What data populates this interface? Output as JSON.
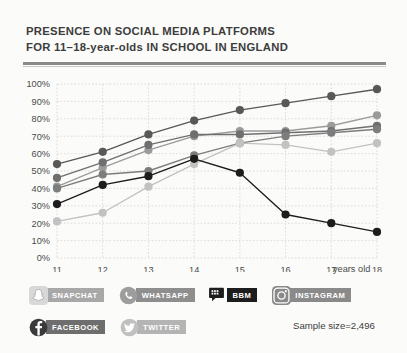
{
  "title": {
    "line1": "PRESENCE ON SOCIAL MEDIA PLATFORMS",
    "line2": "FOR 11–18-year-olds IN SCHOOL IN ENGLAND"
  },
  "axis": {
    "x_label": "years old",
    "y_ticks": [
      "0%",
      "10%",
      "20%",
      "30%",
      "40%",
      "50%",
      "60%",
      "70%",
      "80%",
      "90%",
      "100%"
    ],
    "x_ticks": [
      "11",
      "12",
      "13",
      "14",
      "15",
      "16",
      "17",
      "18"
    ]
  },
  "footnote": {
    "sample_size": "Sample size=2,496"
  },
  "legend": {
    "row1": [
      {
        "label": "SNAPCHAT",
        "icon": "snapchat-icon",
        "badge_color": "#a8a8a8",
        "line_color": "#9b9b9b"
      },
      {
        "label": "WHATSAPP",
        "icon": "whatsapp-icon",
        "badge_color": "#8e8e8e",
        "line_color": "#7d7d7d"
      },
      {
        "label": "BBM",
        "icon": "bbm-icon",
        "badge_color": "#1d1d1d",
        "line_color": "#1d1d1d"
      },
      {
        "label": "INSTAGRAM",
        "icon": "instagram-icon",
        "badge_color": "#8a8a8a",
        "line_color": "#6f6f6f"
      }
    ],
    "row2": [
      {
        "label": "FACEBOOK",
        "icon": "facebook-icon",
        "badge_color": "#6e6e6e",
        "line_color": "#585858"
      },
      {
        "label": "TWITTER",
        "icon": "twitter-icon",
        "badge_color": "#b4b4b4",
        "line_color": "#c2c2c2"
      }
    ]
  },
  "chart_data": {
    "type": "line",
    "xlabel": "years old",
    "ylabel": "",
    "x": [
      11,
      12,
      13,
      14,
      15,
      16,
      17,
      18
    ],
    "xlim": [
      11,
      18
    ],
    "ylim": [
      0,
      100
    ],
    "grid": true,
    "legend_position": "below",
    "series": [
      {
        "name": "FACEBOOK",
        "color": "#585858",
        "values": [
          54,
          61,
          71,
          79,
          85,
          89,
          93,
          97
        ]
      },
      {
        "name": "SNAPCHAT",
        "color": "#9b9b9b",
        "values": [
          41,
          52,
          62,
          70,
          73,
          73,
          76,
          82
        ]
      },
      {
        "name": "INSTAGRAM",
        "color": "#6f6f6f",
        "values": [
          46,
          55,
          65,
          71,
          71,
          72,
          73,
          76
        ]
      },
      {
        "name": "WHATSAPP",
        "color": "#7d7d7d",
        "values": [
          40,
          48,
          50,
          59,
          66,
          70,
          72,
          74
        ]
      },
      {
        "name": "TWITTER",
        "color": "#c2c2c2",
        "values": [
          21,
          26,
          41,
          54,
          66,
          65,
          61,
          66
        ]
      },
      {
        "name": "BBM",
        "color": "#1d1d1d",
        "values": [
          31,
          42,
          47,
          57,
          49,
          25,
          20,
          15
        ]
      }
    ]
  }
}
